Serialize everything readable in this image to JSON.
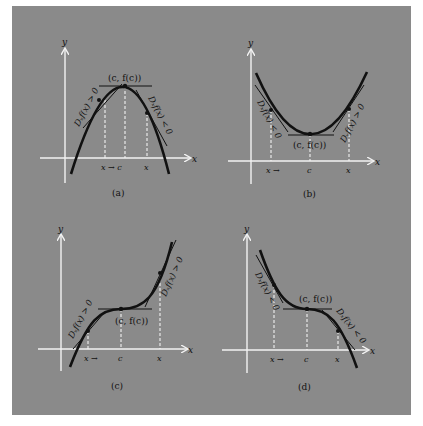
{
  "figure": {
    "background": "#8a8a8a",
    "axis_color": "#f2f2f2",
    "curve_color": "#111111",
    "panels": [
      {
        "id": "a",
        "caption": "(a)",
        "y_axis_label": "y",
        "x_axis_label": "x",
        "point_label": "(c, f(c))",
        "left_slope_label": "Dₓf(x) > 0",
        "right_slope_label": "Dₓf(x) < 0",
        "tick_labels": [
          "x → c",
          "x"
        ],
        "description": "Concave-down parabola with maximum at (c, f(c)); horizontal tangent at top"
      },
      {
        "id": "b",
        "caption": "(b)",
        "y_axis_label": "y",
        "x_axis_label": "x",
        "point_label": "(c, f(c))",
        "left_slope_label": "Dₓf(x) < 0",
        "right_slope_label": "Dₓf(x) > 0",
        "tick_labels": [
          "x →",
          "c",
          "x"
        ],
        "description": "Concave-up parabola with minimum at (c, f(c)); horizontal tangent at bottom"
      },
      {
        "id": "c",
        "caption": "(c)",
        "y_axis_label": "y",
        "x_axis_label": "x",
        "point_label": "(c, f(c))",
        "left_slope_label": "Dₓf(x) > 0",
        "right_slope_label": "Dₓf(x) > 0",
        "tick_labels": [
          "x →",
          "c",
          "x"
        ],
        "description": "Increasing cubic with horizontal inflection at (c, f(c))"
      },
      {
        "id": "d",
        "caption": "(d)",
        "y_axis_label": "y",
        "x_axis_label": "x",
        "point_label": "(c, f(c))",
        "left_slope_label": "Dₓf(x) < 0",
        "right_slope_label": "Dₓf(x) < 0",
        "tick_labels": [
          "x →",
          "c",
          "x"
        ],
        "description": "Decreasing cubic with horizontal inflection at (c, f(c))"
      }
    ]
  }
}
